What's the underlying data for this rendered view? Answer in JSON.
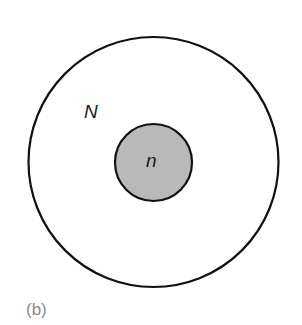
{
  "diagram": {
    "outer_set": {
      "label": "N",
      "fill": "#ffffff",
      "stroke": "#111111"
    },
    "inner_set": {
      "label": "n",
      "fill": "#b9b9b9",
      "stroke": "#111111"
    },
    "panel_label": "(b)"
  }
}
